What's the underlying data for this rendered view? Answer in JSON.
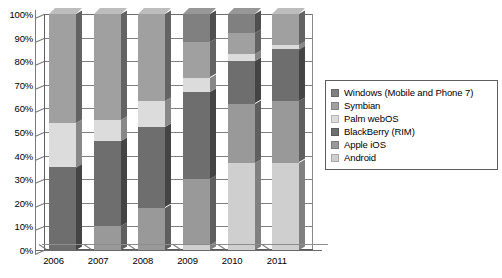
{
  "chart_data": {
    "type": "bar",
    "subtype": "stacked-100-percent-3d",
    "title": "",
    "xlabel": "",
    "ylabel": "",
    "categories": [
      "2006",
      "2007",
      "2008",
      "2009",
      "2010",
      "2011"
    ],
    "ylim": [
      0,
      100
    ],
    "y_ticks": [
      "0%",
      "10%",
      "20%",
      "30%",
      "40%",
      "50%",
      "60%",
      "70%",
      "80%",
      "90%",
      "100%"
    ],
    "y_tick_values": [
      0,
      10,
      20,
      30,
      40,
      50,
      60,
      70,
      80,
      90,
      100
    ],
    "grid": true,
    "legend_position": "right",
    "stack_order_bottom_to_top": [
      "Android",
      "Apple iOS",
      "BlackBerry (RIM)",
      "Palm webOS",
      "Symbian",
      "Windows (Mobile and Phone 7)"
    ],
    "series": [
      {
        "name": "Windows (Mobile and Phone 7)",
        "color": "#808080",
        "values": [
          0,
          0,
          0,
          12,
          8,
          0
        ]
      },
      {
        "name": "Symbian",
        "color": "#a0a0a0",
        "values": [
          46,
          45,
          37,
          15,
          9,
          13
        ]
      },
      {
        "name": "Palm webOS",
        "color": "#dcdcdc",
        "values": [
          19,
          9,
          11,
          6,
          3,
          2
        ]
      },
      {
        "name": "BlackBerry (RIM)",
        "color": "#6e6e6e",
        "values": [
          35,
          36,
          34,
          37,
          18,
          22
        ]
      },
      {
        "name": "Apple iOS",
        "color": "#999999",
        "values": [
          0,
          10,
          18,
          28,
          25,
          26
        ]
      },
      {
        "name": "Android",
        "color": "#cfcfcf",
        "values": [
          0,
          0,
          0,
          2,
          37,
          37
        ]
      }
    ]
  },
  "legend": {
    "items": [
      {
        "label": "Windows (Mobile and Phone 7)",
        "color": "#808080"
      },
      {
        "label": "Symbian",
        "color": "#a0a0a0"
      },
      {
        "label": "Palm webOS",
        "color": "#dcdcdc"
      },
      {
        "label": "BlackBerry (RIM)",
        "color": "#6e6e6e"
      },
      {
        "label": "Apple iOS",
        "color": "#999999"
      },
      {
        "label": "Android",
        "color": "#cfcfcf"
      }
    ]
  }
}
